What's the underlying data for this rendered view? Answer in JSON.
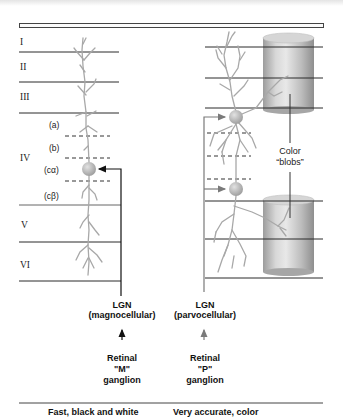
{
  "diagram": {
    "layers": [
      {
        "label": "I"
      },
      {
        "label": "II"
      },
      {
        "label": "III"
      },
      {
        "label": "IV"
      },
      {
        "label": "V"
      },
      {
        "label": "VI"
      }
    ],
    "sublayers": [
      {
        "label": "(a)"
      },
      {
        "label": "(b)"
      },
      {
        "label": "(cα)"
      },
      {
        "label": "(cβ)"
      }
    ],
    "left_pathway": {
      "lgn_title": "LGN",
      "lgn_subtitle": "(magnocellular)",
      "retina_line1": "Retinal",
      "retina_line2": "\"M\"",
      "retina_line3": "ganglion",
      "caption": "Fast, black and white",
      "arrow_color": "#111111"
    },
    "right_pathway": {
      "lgn_title": "LGN",
      "lgn_subtitle": "(parvocellular)",
      "retina_line1": "Retinal",
      "retina_line2": "\"P\"",
      "retina_line3": "ganglion",
      "caption": "Very accurate, color",
      "arrow_color": "#7a7a7a"
    },
    "blobs": {
      "line1": "Color",
      "line2": "“blobs”"
    },
    "colors": {
      "layer_line": "#2a2a2a",
      "neuron": "#a8a8a8",
      "cylinder_light": "#e6e6e6",
      "cylinder_dark": "#9a9a9a"
    }
  }
}
